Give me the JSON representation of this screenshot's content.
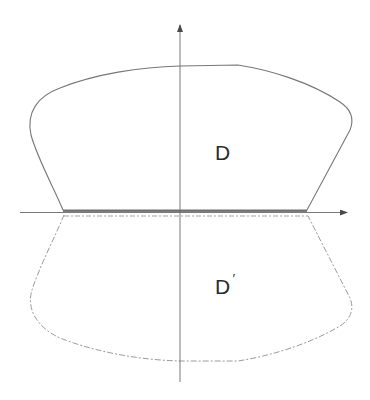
{
  "diagram": {
    "type": "region-reflection",
    "axes": {
      "x_axis": {
        "from": [
          20,
          212
        ],
        "to": [
          348,
          212
        ],
        "arrow": true
      },
      "y_axis": {
        "from": [
          180,
          382
        ],
        "to": [
          180,
          24
        ],
        "arrow": true
      },
      "color": "#6e6e6e"
    },
    "regions": [
      {
        "id": "D",
        "label": "D",
        "label_position": [
          216,
          160
        ],
        "boundary_style": "solid",
        "color": "#7a7a7a"
      },
      {
        "id": "D_prime",
        "label": "D",
        "prime_mark": "′",
        "label_position": [
          216,
          294
        ],
        "boundary_style": "dashed",
        "color": "#a8a8a8"
      }
    ]
  }
}
